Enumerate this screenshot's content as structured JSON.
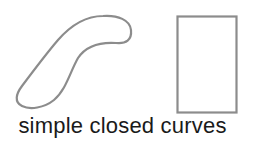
{
  "figure": {
    "caption": "simple closed curves",
    "shapes": [
      {
        "name": "blob-curve",
        "kind": "freeform closed curve"
      },
      {
        "name": "rectangle",
        "kind": "rectangle"
      }
    ],
    "colors": {
      "stroke": "#8c8c8c",
      "text": "#1a1a1a",
      "background": "#ffffff"
    }
  }
}
